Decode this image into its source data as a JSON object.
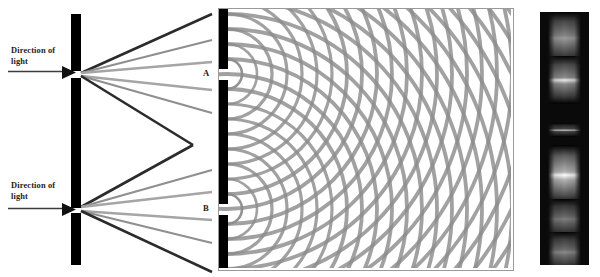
{
  "figure": {
    "background_color": "#ffffff"
  },
  "panel_ray": {
    "name": "ray-diagram-panel",
    "barrier": {
      "color": "#000000",
      "x": 71,
      "width": 10,
      "top": 14,
      "bottom": 265,
      "slit_top_y": 73,
      "slit_bottom_y": 210,
      "slit_height": 5
    },
    "labels": {
      "top": "Direction of\nlight",
      "bottom": "Direction of\nlight"
    },
    "incoming_arrow_color": "#3c3c3c",
    "ray_colors": {
      "dark": "#2b2b2b",
      "mid": "#707070",
      "light": "#a8a8a8"
    },
    "crossing_point": {
      "x": 193,
      "y": 145
    }
  },
  "panel_wave": {
    "name": "wavefront-interference-panel",
    "border_color": "#9a9a9a",
    "wave_color": "#8c8c8c",
    "wave_color_dark": "#6e6e6e",
    "background": "#ffffff",
    "source_a": {
      "label": "A",
      "x": 8,
      "y": 65
    },
    "source_b": {
      "label": "B",
      "x": 8,
      "y": 200
    },
    "wavelength_px": 15,
    "ring_count": 34,
    "barrier_color": "#000000"
  },
  "panel_fringe": {
    "name": "interference-fringe-photograph",
    "background": "#0a0a0a",
    "fringes": [
      {
        "center_y": 26,
        "height": 26,
        "brightness": 0.52,
        "core": 0.62
      },
      {
        "center_y": 68,
        "height": 24,
        "brightness": 0.55,
        "core": 0.92
      },
      {
        "center_y": 118,
        "height": 7,
        "brightness": 0.3,
        "core": 1.0
      },
      {
        "center_y": 163,
        "height": 30,
        "brightness": 0.7,
        "core": 1.0
      },
      {
        "center_y": 207,
        "height": 20,
        "brightness": 0.42,
        "core": 0.5
      },
      {
        "center_y": 240,
        "height": 20,
        "brightness": 0.44,
        "core": 0.55
      }
    ]
  },
  "chart_data": {
    "type": "line",
    "xlabel": "",
    "ylabel": "",
    "annotations": [
      "Direction of light",
      "Direction of light",
      "A",
      "B"
    ],
    "series": [
      {
        "name": "wavefronts-from-A",
        "values": []
      },
      {
        "name": "wavefronts-from-B",
        "values": []
      }
    ]
  }
}
